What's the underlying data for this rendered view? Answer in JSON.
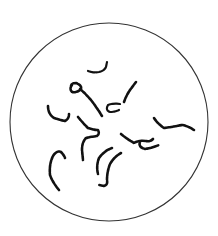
{
  "figure": {
    "description": "Microscope field of view (circle) containing scattered curved, beaded strands",
    "field_shape": "circle",
    "strand_count": 11,
    "colors": {
      "background": "#ffffff",
      "outline": "#333333",
      "strands": "#111111"
    }
  }
}
